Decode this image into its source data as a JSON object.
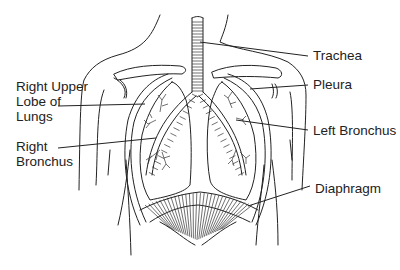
{
  "diagram": {
    "labels": {
      "right_upper_lobe": [
        "Right Upper",
        "Lobe of",
        "Lungs"
      ],
      "right_bronchus": [
        "Right",
        "Bronchus"
      ],
      "trachea": "Trachea",
      "pleura": "Pleura",
      "left_bronchus": "Left Bronchus",
      "diaphragm": "Diaphragm"
    },
    "colors": {
      "ink": "#222222",
      "background": "#ffffff"
    }
  }
}
